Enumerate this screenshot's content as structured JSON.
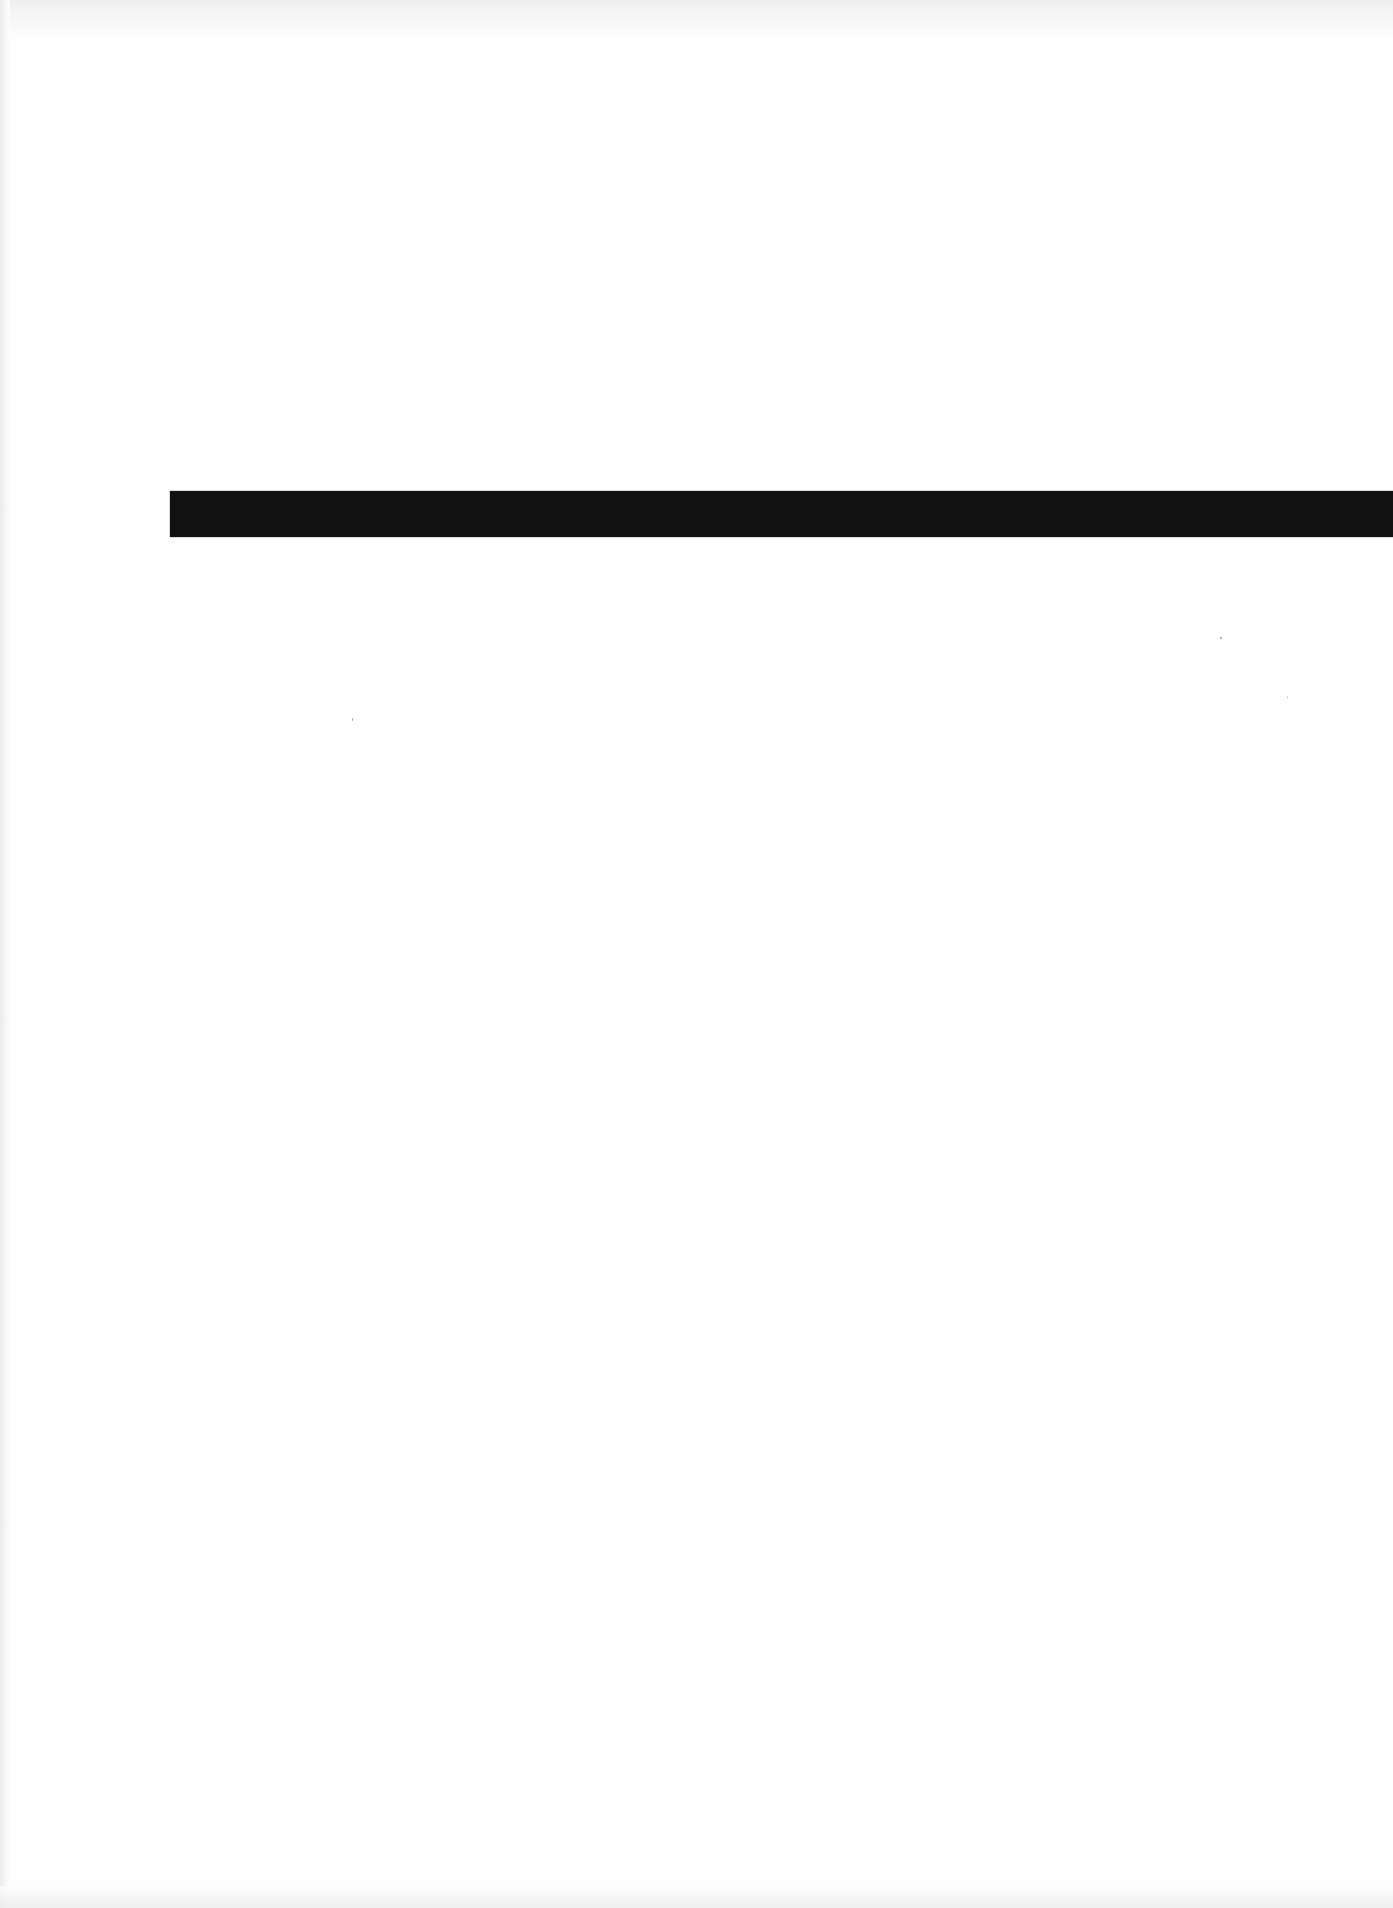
{
  "document": {
    "type": "scanned-page",
    "text_content": "",
    "elements": {
      "rule_bar": {
        "color": "#111111",
        "x": 170,
        "y": 491,
        "width": 1223,
        "height": 46
      }
    },
    "colors": {
      "paper": "#fefefe",
      "ink": "#111111",
      "scan_noise": "#ececec"
    }
  }
}
